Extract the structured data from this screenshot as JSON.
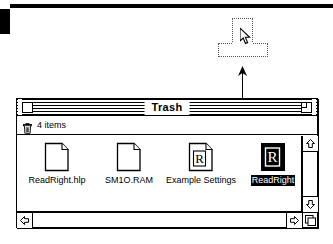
{
  "desktop": {
    "background_color": "#ffffff",
    "menubar_color": "#000000"
  },
  "drag": {
    "ghost_name": "trash-can-ghost-outline",
    "cursor_name": "arrow-pointer",
    "arrow_name": "drag-direction-arrow",
    "direction": "up"
  },
  "window": {
    "title": "Trash",
    "close_box_label": "",
    "zoom_box_label": "",
    "info_count": "4 items",
    "trash_icon_name": "trash-can-icon"
  },
  "files": [
    {
      "label": "ReadRight.hlp",
      "icon": "document-icon",
      "selected": false
    },
    {
      "label": "SM1O.RAM",
      "icon": "document-icon",
      "selected": false
    },
    {
      "label": "Example Settings",
      "icon": "document-r-icon",
      "selected": false
    },
    {
      "label": "ReadRight",
      "icon": "application-r-icon",
      "selected": true
    }
  ],
  "scrollbars": {
    "vertical": {
      "up_arrow": "scroll-up-arrow",
      "down_arrow": "scroll-down-arrow"
    },
    "horizontal": {
      "left_arrow": "scroll-left-arrow",
      "right_arrow": "scroll-right-arrow"
    },
    "grow_box": "grow-box"
  },
  "colors": {
    "foreground": "#000000",
    "background": "#ffffff",
    "selection": "#000000"
  }
}
